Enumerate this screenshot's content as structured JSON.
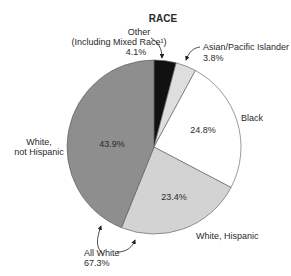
{
  "chart_data": {
    "type": "pie",
    "title": "RACE",
    "start_angle_deg": 0,
    "direction": "clockwise",
    "slices": [
      {
        "label": "Other (Including Mixed Race¹)",
        "value": 4.1,
        "color": "#111111"
      },
      {
        "label": "Asian/Pacific Islander",
        "value": 3.8,
        "color": "#dedede"
      },
      {
        "label": "Black",
        "value": 24.8,
        "color": "#ffffff"
      },
      {
        "label": "White, Hispanic",
        "value": 23.4,
        "color": "#d3d3d3"
      },
      {
        "label": "White, not Hispanic",
        "value": 43.9,
        "color": "#8e8e8e"
      }
    ],
    "annotations": [
      {
        "label": "All White",
        "value": "67.3%",
        "note": "White, Hispanic + White, not Hispanic"
      }
    ]
  },
  "labels": {
    "title": "RACE",
    "other_line1": "Other",
    "other_line2": "(Including Mixed Race¹)",
    "other_value": "4.1%",
    "asian_line1": "Asian/Pacific Islander",
    "asian_value": "3.8%",
    "black_label": "Black",
    "black_value": "24.8%",
    "white_nh_line1": "White,",
    "white_nh_line2": "not Hispanic",
    "white_nh_value": "43.9%",
    "white_h_label": "White, Hispanic",
    "white_h_value": "23.4%",
    "all_white_label": "All White",
    "all_white_value": "67.3%"
  }
}
